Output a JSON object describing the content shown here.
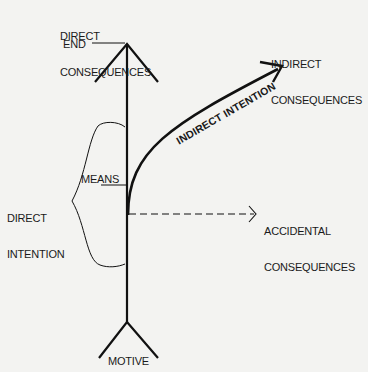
{
  "diagram": {
    "labels": {
      "direct_consequences": [
        "DIRECT",
        "CONSEQUENCES"
      ],
      "end": "END",
      "indirect_consequences": [
        "INDIRECT",
        "CONSEQUENCES"
      ],
      "indirect_intention": "INDIRECT INTENTION",
      "means": "MEANS",
      "direct_intention": [
        "DIRECT",
        "INTENTION"
      ],
      "accidental_consequences": [
        "ACCIDENTAL",
        "CONSEQUENCES"
      ],
      "motive": "MOTIVE"
    },
    "colors": {
      "ink": "#111111",
      "paper": "#f3f3f1"
    }
  }
}
